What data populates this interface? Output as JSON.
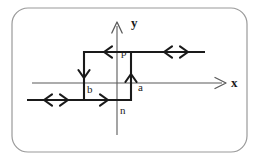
{
  "figure": {
    "type": "line-diagram",
    "background_color": "#ffffff",
    "stroke_color": "#1a1a1a",
    "axis_color": "#555555",
    "border": {
      "name": "rounded-frame",
      "x": 12,
      "y": 8,
      "width": 235,
      "height": 144,
      "radius": 16,
      "color": "#9a9a9a",
      "stroke_width": 1.2
    },
    "axes": {
      "x_axis": {
        "label": "x",
        "from_x": 32,
        "to_x": 226,
        "y": 83,
        "arrow": "right"
      },
      "y_axis": {
        "label": "y",
        "x": 117,
        "from_y": 135,
        "to_y": 22,
        "arrow": "up"
      }
    },
    "path_points": [
      {
        "label": "p",
        "x": 131,
        "y": 52
      },
      {
        "label": "a",
        "x": 131,
        "y": 100
      },
      {
        "label": "b",
        "x": 84,
        "y": 83
      },
      {
        "label": "n",
        "x": 117,
        "y": 100
      }
    ],
    "segments": [
      {
        "name": "top-right-segment",
        "x1": 205,
        "y1": 52,
        "x2": 131,
        "y2": 52,
        "arrows": [
          "left-right-pair-at-170"
        ]
      },
      {
        "name": "top-left-segment",
        "x1": 131,
        "y1": 52,
        "x2": 84,
        "y2": 52,
        "arrows": [
          "left-at-108"
        ]
      },
      {
        "name": "left-vertical",
        "x1": 84,
        "y1": 52,
        "x2": 84,
        "y2": 100,
        "arrows": [
          "down-at-76"
        ]
      },
      {
        "name": "bottom-middle",
        "x1": 84,
        "y1": 100,
        "x2": 131,
        "y2": 100,
        "arrows": [
          "right-at-108"
        ]
      },
      {
        "name": "right-vertical",
        "x1": 131,
        "y1": 100,
        "x2": 131,
        "y2": 52,
        "arrows": [
          "up-at-76"
        ]
      },
      {
        "name": "bottom-left-segment",
        "x1": 27,
        "y1": 100,
        "x2": 84,
        "y2": 100,
        "arrows": [
          "left-right-pair-at-52"
        ]
      }
    ],
    "arrow_markers": [
      {
        "name": "y-axis-arrowhead",
        "direction": "up"
      },
      {
        "name": "x-axis-arrowhead",
        "direction": "right"
      },
      {
        "name": "top-left-arrowhead",
        "direction": "left"
      },
      {
        "name": "top-right-double-arrow",
        "direction": "left-right"
      },
      {
        "name": "left-vertical-arrowhead",
        "direction": "down"
      },
      {
        "name": "right-vertical-arrowhead",
        "direction": "up"
      },
      {
        "name": "bottom-mid-arrowhead",
        "direction": "right"
      },
      {
        "name": "bottom-left-double-arrow",
        "direction": "left-right"
      }
    ]
  }
}
